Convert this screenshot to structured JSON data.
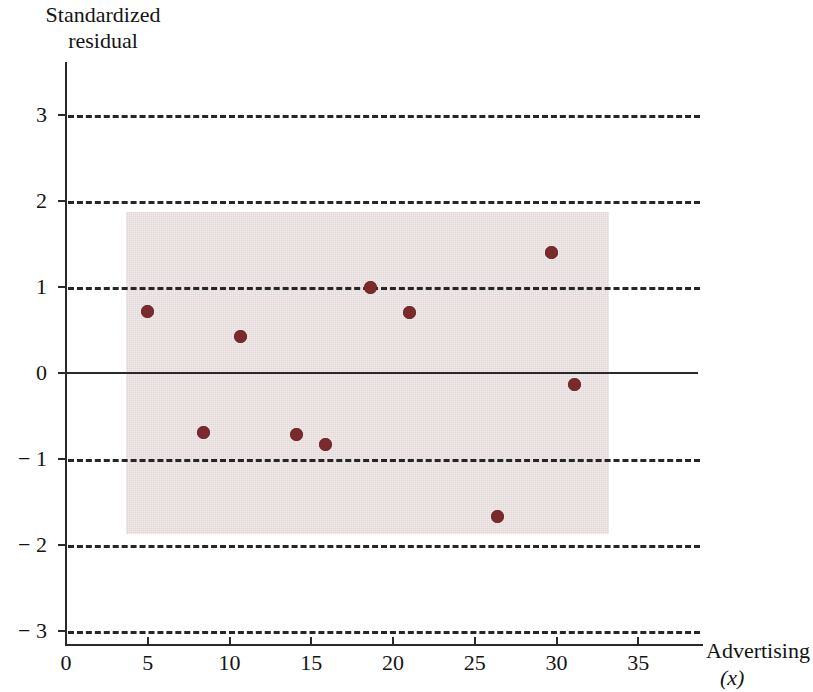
{
  "chart_data": {
    "type": "scatter",
    "title": "",
    "ylabel": "Standardized\nresidual",
    "xlabel": "Advertising",
    "xlabel_sub": "(x)",
    "xlim": [
      0,
      39
    ],
    "ylim": [
      -3.4,
      3.4
    ],
    "grid": "horizontal dashed gridlines at y = 3, 2, 1, -1, -2, -3; solid reference line at y = 0",
    "legend": "none",
    "xticks": [
      0,
      5,
      10,
      15,
      20,
      25,
      30,
      35
    ],
    "xtick_labels": [
      "0",
      "5",
      "10",
      "15",
      "20",
      "25",
      "30",
      "35"
    ],
    "yticks": [
      3,
      2,
      1,
      0,
      -1,
      -2,
      -3
    ],
    "ytick_labels": [
      "3",
      "2",
      "1",
      "0",
      "− 1",
      "− 2",
      "− 3"
    ],
    "gridline_values": [
      3,
      2,
      1,
      -1,
      -2,
      -3
    ],
    "zero_line_value": 0,
    "shaded_band": {
      "label": "data-region shading",
      "x_range": [
        3.7,
        33.2
      ],
      "y_range": [
        -1.87,
        1.87
      ],
      "color": "#e2d6d6"
    },
    "point_color": "#7a2a2c",
    "points": [
      {
        "x": 5.0,
        "y": 0.71
      },
      {
        "x": 8.4,
        "y": -0.69
      },
      {
        "x": 10.7,
        "y": 0.42
      },
      {
        "x": 14.1,
        "y": -0.71
      },
      {
        "x": 15.9,
        "y": -0.83
      },
      {
        "x": 18.6,
        "y": 0.99
      },
      {
        "x": 21.0,
        "y": 0.7
      },
      {
        "x": 26.4,
        "y": -1.67
      },
      {
        "x": 29.7,
        "y": 1.4
      },
      {
        "x": 31.1,
        "y": -0.13
      }
    ]
  }
}
